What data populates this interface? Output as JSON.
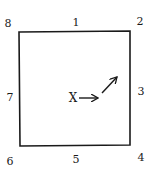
{
  "diagram": {
    "position_labels": {
      "top_left": "8",
      "top": "1",
      "top_right": "2",
      "right": "3",
      "bottom_right": "4",
      "bottom": "5",
      "bottom_left": "6",
      "left": "7"
    },
    "center_marker": "X",
    "arrows": [
      {
        "name": "arrow-right",
        "direction": "right"
      },
      {
        "name": "arrow-up-right",
        "direction": "up-right"
      }
    ],
    "colors": {
      "stroke": "#1a1a1a",
      "background": "#ffffff"
    }
  }
}
